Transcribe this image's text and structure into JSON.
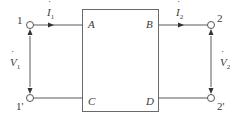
{
  "diagram": {
    "type": "two-port network",
    "block": {
      "corners": [
        "A",
        "B",
        "C",
        "D"
      ]
    },
    "terminals": {
      "input_top": "1",
      "input_bottom": "1'",
      "output_top": "2",
      "output_bottom": "2'"
    },
    "currents": {
      "i1": {
        "symbol": "I",
        "sub": "1"
      },
      "i2": {
        "symbol": "I",
        "sub": "2"
      }
    },
    "voltages": {
      "v1": {
        "symbol": "V",
        "sub": "1"
      },
      "v2": {
        "symbol": "V",
        "sub": "2"
      }
    },
    "colors": {
      "line": "#5a5a5a",
      "text": "#3a3a3a",
      "background": "#ffffff"
    }
  }
}
